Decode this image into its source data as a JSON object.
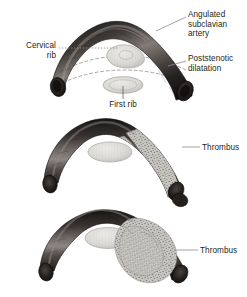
{
  "figure": {
    "title_visible": false,
    "background_color": "#ffffff",
    "panel_count": 3,
    "description_domain": "medical-illustration"
  },
  "colors": {
    "vessel_dark": "#2b2724",
    "vessel_mid": "#4a4441",
    "vessel_highlight": "#8d8682",
    "vessel_shadow": "#131110",
    "rib_fill": "#d8d6d2",
    "rib_stroke": "#a9a6a1",
    "thrombus_fill": "#c9c7c2",
    "thrombus_speckle": "#6e6b66",
    "leader_line": "#8a8a8a",
    "dashed_rib_outline": "#9b9894",
    "text": "#231f20"
  },
  "panels": [
    {
      "id": "panel-top",
      "name": "angulated-subclavian-artery-with-cervical-rib",
      "labels": [
        {
          "id": "label-angulated-subclavian-artery",
          "lines": [
            "Angulated",
            "subclavian",
            "artery"
          ],
          "align": "left",
          "leader": "solid"
        },
        {
          "id": "label-poststenotic-dilatation",
          "lines": [
            "Poststenotic",
            "dilatation"
          ],
          "align": "left",
          "leader": "solid"
        },
        {
          "id": "label-cervical-rib",
          "lines": [
            "Cervical",
            "rib"
          ],
          "align": "right",
          "leader": "dotted"
        },
        {
          "id": "label-first-rib",
          "lines": [
            "First rib"
          ],
          "align": "center",
          "leader": "solid-vertical"
        }
      ],
      "structures": [
        "cervical-rib",
        "first-rib",
        "artery",
        "dashed-rib-arcs"
      ]
    },
    {
      "id": "panel-middle",
      "name": "subclavian-artery-with-mural-thrombus",
      "labels": [
        {
          "id": "label-thrombus-middle",
          "lines": [
            "Thrombus"
          ],
          "align": "left",
          "leader": "solid"
        }
      ],
      "structures": [
        "first-rib",
        "artery",
        "thrombus"
      ]
    },
    {
      "id": "panel-bottom",
      "name": "subclavian-artery-with-large-occlusive-thrombus",
      "labels": [
        {
          "id": "label-thrombus-bottom",
          "lines": [
            "Thrombus"
          ],
          "align": "left",
          "leader": "solid"
        }
      ],
      "structures": [
        "first-rib",
        "artery",
        "thrombus-large"
      ]
    }
  ],
  "text": {
    "angulated_line1": "Angulated",
    "angulated_line2": "subclavian",
    "angulated_line3": "artery",
    "poststenotic_line1": "Poststenotic",
    "poststenotic_line2": "dilatation",
    "cervical_line1": "Cervical",
    "cervical_line2": "rib",
    "first_rib": "First rib",
    "thrombus_middle": "Thrombus",
    "thrombus_bottom": "Thrombus"
  }
}
